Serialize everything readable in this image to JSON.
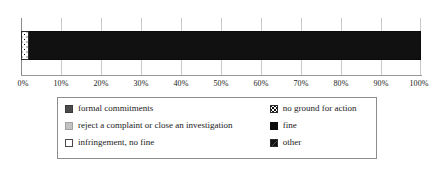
{
  "chart_data": {
    "type": "bar",
    "orientation": "horizontal",
    "stacked": true,
    "normalized_percent": true,
    "title": "",
    "subtitle": "",
    "xlabel": "",
    "ylabel": "",
    "xlim": [
      0,
      100
    ],
    "categories": [
      ""
    ],
    "grid": true,
    "legend_position": "bottom",
    "tick_labels": [
      "0%",
      "10%",
      "20%",
      "30%",
      "40%",
      "50%",
      "60%",
      "70%",
      "80%",
      "90%",
      "100%"
    ],
    "tick_values": [
      0,
      10,
      20,
      30,
      40,
      50,
      60,
      70,
      80,
      90,
      100
    ],
    "series": [
      {
        "name": "formal commitments",
        "values": [
          0
        ],
        "swatch": "dark-gray-square",
        "color": "#4c4c4c"
      },
      {
        "name": "reject a complaint or close an investigation",
        "values": [
          0
        ],
        "swatch": "light-gray-square",
        "color": "#c2c2c2"
      },
      {
        "name": "infringement, no fine",
        "values": [
          0
        ],
        "swatch": "white-square",
        "color": "#ffffff"
      },
      {
        "name": "no ground for action",
        "values": [
          2
        ],
        "swatch": "dotted-square",
        "color": "#ffffff"
      },
      {
        "name": "fine",
        "values": [
          98
        ],
        "swatch": "black-square",
        "color": "#111111"
      },
      {
        "name": "other",
        "values": [
          0
        ],
        "swatch": "diagonal-split-square",
        "color": "#111111"
      }
    ],
    "bar_segments": [
      {
        "label": "no ground for action",
        "value": 2,
        "fill": "dots"
      },
      {
        "label": "fine",
        "value": 98,
        "fill": "solid-black"
      }
    ]
  },
  "axis": {
    "ticks": [
      {
        "label": "0%",
        "pos": 0
      },
      {
        "label": "10%",
        "pos": 10
      },
      {
        "label": "20%",
        "pos": 20
      },
      {
        "label": "30%",
        "pos": 30
      },
      {
        "label": "40%",
        "pos": 40
      },
      {
        "label": "50%",
        "pos": 50
      },
      {
        "label": "60%",
        "pos": 60
      },
      {
        "label": "70%",
        "pos": 70
      },
      {
        "label": "80%",
        "pos": 80
      },
      {
        "label": "90%",
        "pos": 90
      },
      {
        "label": "100%",
        "pos": 100
      }
    ]
  },
  "legend": {
    "rows": [
      {
        "left": {
          "label": "formal commitments",
          "swatch": "dark-gray-square"
        },
        "right": {
          "label": "no ground for action",
          "swatch": "dotted-square"
        }
      },
      {
        "left": {
          "label": "reject a complaint or close an investigation",
          "swatch": "light-gray-square"
        },
        "right": {
          "label": "fine",
          "swatch": "black-square"
        }
      },
      {
        "left": {
          "label": "infringement, no fine",
          "swatch": "white-square"
        },
        "right": {
          "label": "other",
          "swatch": "diagonal-split-square"
        }
      }
    ]
  },
  "colors": {
    "background": "#ffffff",
    "gridline": "#c9c9c9",
    "axis": "#8a8a8a",
    "text": "#1a1a1a",
    "legend_border": "#8d8d8d"
  }
}
